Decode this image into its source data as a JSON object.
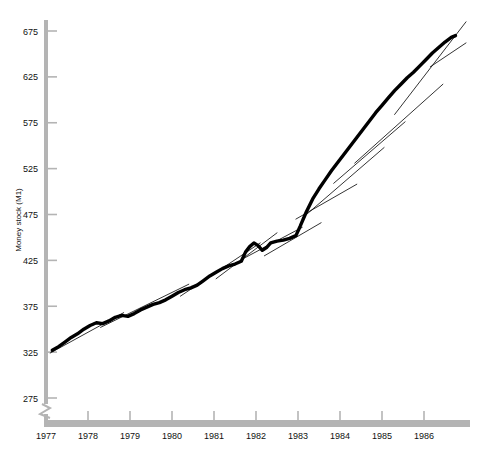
{
  "chart_data": {
    "type": "line",
    "title": "",
    "xlabel": "",
    "ylabel": "Money stock (M1)",
    "ylim": [
      275,
      675
    ],
    "yticks": [
      275,
      325,
      375,
      425,
      475,
      525,
      575,
      625,
      675
    ],
    "ytick_labels": [
      "275",
      "325",
      "375",
      "425",
      "475",
      "525",
      "575",
      "625",
      "675"
    ],
    "xlim": [
      1977.0,
      1987.0
    ],
    "xticks": [
      1977,
      1978,
      1979,
      1980,
      1981,
      1982,
      1983,
      1984,
      1985,
      1986
    ],
    "xtick_labels": [
      "1977",
      "1978",
      "1979",
      "1980",
      "1981",
      "1982",
      "1983",
      "1984",
      "1985",
      "1986"
    ],
    "grid": false,
    "legend": "none",
    "axis_break": {
      "present": true,
      "axis": "y",
      "below": 275
    },
    "colors": {
      "axis": "#b4b4b4",
      "data_line": "#000000",
      "trend_line": "#000000",
      "text": "#111111",
      "background": "#ffffff"
    },
    "series": [
      {
        "name": "Money stock (M1)",
        "style": "thick-black-line",
        "points": [
          [
            1977.15,
            327
          ],
          [
            1977.3,
            331
          ],
          [
            1977.45,
            336
          ],
          [
            1977.6,
            341
          ],
          [
            1977.75,
            345
          ],
          [
            1977.9,
            350
          ],
          [
            1978.05,
            354
          ],
          [
            1978.2,
            357
          ],
          [
            1978.35,
            356
          ],
          [
            1978.5,
            359
          ],
          [
            1978.65,
            363
          ],
          [
            1978.8,
            365
          ],
          [
            1978.95,
            364
          ],
          [
            1979.1,
            367
          ],
          [
            1979.25,
            371
          ],
          [
            1979.4,
            374
          ],
          [
            1979.55,
            377
          ],
          [
            1979.7,
            379
          ],
          [
            1979.85,
            382
          ],
          [
            1980.0,
            386
          ],
          [
            1980.15,
            390
          ],
          [
            1980.3,
            393
          ],
          [
            1980.45,
            395
          ],
          [
            1980.6,
            398
          ],
          [
            1980.75,
            403
          ],
          [
            1980.9,
            408
          ],
          [
            1981.05,
            412
          ],
          [
            1981.2,
            416
          ],
          [
            1981.35,
            419
          ],
          [
            1981.5,
            421
          ],
          [
            1981.65,
            424
          ],
          [
            1981.75,
            434
          ],
          [
            1981.85,
            440
          ],
          [
            1981.95,
            444
          ],
          [
            1982.05,
            441
          ],
          [
            1982.15,
            436
          ],
          [
            1982.25,
            439
          ],
          [
            1982.35,
            444
          ],
          [
            1982.5,
            446
          ],
          [
            1982.65,
            447
          ],
          [
            1982.8,
            449
          ],
          [
            1982.95,
            452
          ],
          [
            1983.05,
            462
          ],
          [
            1983.2,
            478
          ],
          [
            1983.35,
            492
          ],
          [
            1983.5,
            503
          ],
          [
            1983.65,
            513
          ],
          [
            1983.8,
            523
          ],
          [
            1983.95,
            532
          ],
          [
            1984.1,
            541
          ],
          [
            1984.25,
            550
          ],
          [
            1984.4,
            559
          ],
          [
            1984.55,
            568
          ],
          [
            1984.7,
            577
          ],
          [
            1984.85,
            586
          ],
          [
            1985.0,
            594
          ],
          [
            1985.15,
            602
          ],
          [
            1985.3,
            610
          ],
          [
            1985.45,
            617
          ],
          [
            1985.6,
            624
          ],
          [
            1985.75,
            630
          ],
          [
            1985.9,
            637
          ],
          [
            1986.05,
            644
          ],
          [
            1986.2,
            651
          ],
          [
            1986.35,
            657
          ],
          [
            1986.5,
            663
          ],
          [
            1986.65,
            668
          ],
          [
            1986.75,
            670
          ]
        ]
      }
    ],
    "trend_segments": [
      {
        "name": "trend-1977-1978",
        "x0": 1977.1,
        "y0": 324,
        "x1": 1978.85,
        "y1": 368
      },
      {
        "name": "trend-1978-1980",
        "x0": 1978.3,
        "y0": 352,
        "x1": 1980.4,
        "y1": 399
      },
      {
        "name": "trend-1980-1982",
        "x0": 1980.2,
        "y0": 386,
        "x1": 1982.1,
        "y1": 444
      },
      {
        "name": "trend-1981-1982",
        "x0": 1981.05,
        "y0": 405,
        "x1": 1982.5,
        "y1": 455
      },
      {
        "name": "trend-1981b-1983",
        "x0": 1981.7,
        "y0": 427,
        "x1": 1983.1,
        "y1": 461
      },
      {
        "name": "trend-1982-1983",
        "x0": 1982.2,
        "y0": 430,
        "x1": 1983.55,
        "y1": 466
      },
      {
        "name": "trend-1983-1984",
        "x0": 1982.95,
        "y0": 470,
        "x1": 1984.4,
        "y1": 508
      },
      {
        "name": "trend-1983b-1985",
        "x0": 1983.1,
        "y0": 471,
        "x1": 1985.05,
        "y1": 548
      },
      {
        "name": "trend-1984-1985",
        "x0": 1983.85,
        "y0": 509,
        "x1": 1985.55,
        "y1": 576
      },
      {
        "name": "trend-1984b-1986",
        "x0": 1984.35,
        "y0": 531,
        "x1": 1986.45,
        "y1": 617
      },
      {
        "name": "trend-1985-1987",
        "x0": 1985.3,
        "y0": 584,
        "x1": 1987.0,
        "y1": 685
      },
      {
        "name": "trend-1986-1987",
        "x0": 1986.15,
        "y0": 636,
        "x1": 1987.0,
        "y1": 662
      }
    ]
  }
}
